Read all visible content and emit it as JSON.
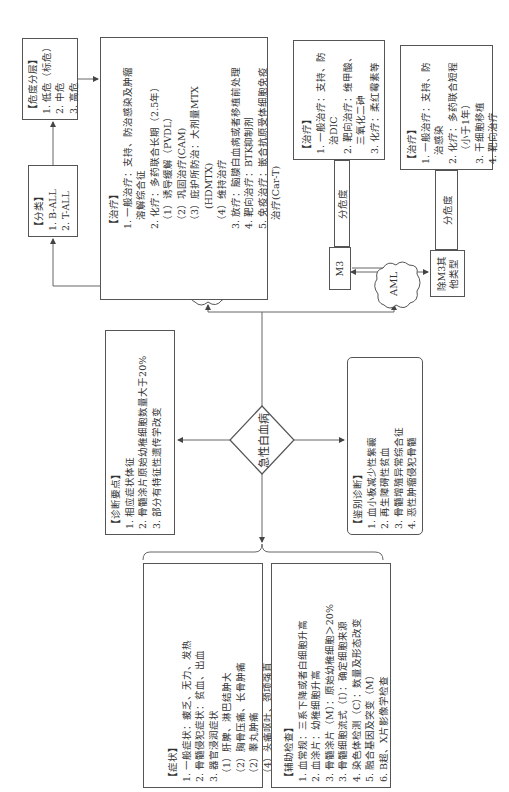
{
  "center": {
    "label": "急性白血病"
  },
  "clouds": {
    "all": "ALL",
    "aml": "AML"
  },
  "diagnosis_points": {
    "title": "诊断要点",
    "items": [
      "1. 相应症状体征",
      "2. 骨髓涂片原始幼稚细胞数量大于20%",
      "3. 部分有特征性遗传学改变"
    ]
  },
  "differential": {
    "title": "鉴别诊断",
    "items": [
      "1. 血小板减少性紫癜",
      "2. 再生障碍性贫血",
      "3. 骨髓增殖异常综合征",
      "4. 恶性肿瘤侵犯骨髓"
    ]
  },
  "symptoms": {
    "title": "症状",
    "items": [
      "1. 一般症状：疲乏、无力、发热",
      "2. 骨髓侵犯症状：贫血、出血",
      "3. 器官浸润症状"
    ],
    "sub": [
      "（1）肝脾、淋巴结肿大",
      "（2）胸骨压痛、长骨肿痛",
      "（2）睾丸肿痛",
      "（4）头痛呕吐、颈项强直"
    ]
  },
  "aux_exam": {
    "title": "辅助检查",
    "items": [
      "1. 血常规：三系下降或者白细胞升高",
      "2. 血涂片：幼稚细胞升高",
      "3. 骨髓涂片（M）：原始幼稚细胞＞20%",
      "3. 骨髓细胞流式（I）：确定细胞来源",
      "4. 染色体检测（C）：数量及形态改变",
      "5. 融合基因及突变（M）",
      "6. B超、X片影像学检查"
    ]
  },
  "all_classification": {
    "title": "分类",
    "items": [
      "1. B-ALL",
      "2. T-ALL"
    ]
  },
  "all_risk": {
    "title": "危度分层",
    "items": [
      "1. 低危（标危）",
      "2. 中危",
      "3. 高危"
    ]
  },
  "all_treatment": {
    "title": "治疗",
    "lines": [
      "1. 一般治疗：支持、防治感染及肿瘤",
      "溶解综合征",
      "2. 化疗：多药联合长期（2.5年）",
      "（1）诱导缓解（PVDL）",
      "（2）巩固治疗(CAM)",
      "（3）庇护所防治：大剂量MTX",
      "(HDMTX)",
      "（4）维持治疗",
      "3. 放疗：脑膜白血病或者移植前处理",
      "4. 靶向治疗：BTK抑制剂",
      "5. 免疫治疗：嵌合抗原受体细胞免疫",
      "治疗(Car-T)"
    ]
  },
  "m3": {
    "label": "M3",
    "risk_bar": "分危度",
    "treatment": {
      "title": "治疗",
      "lines": [
        "1. 一般治疗：支持、防",
        "治DIC",
        "2. 靶向治疗：维甲酸、",
        "三氧化二砷",
        "3. 化疗：柔红霉素等"
      ]
    }
  },
  "non_m3": {
    "label_line1": "除M3其",
    "label_line2": "他类型",
    "risk_bar": "分危度",
    "treatment": {
      "title": "治疗",
      "lines": [
        "1. 一般治疗：支持、防",
        "治感染",
        "2. 化疗：多药联合短程",
        "（小于1年）",
        "3. 干细胞移植",
        "4. 靶向治疗"
      ]
    }
  }
}
